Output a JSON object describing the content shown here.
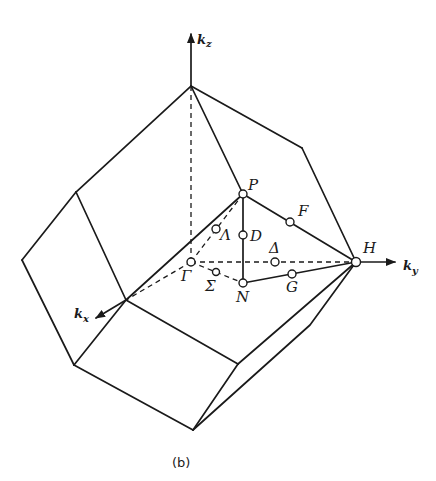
{
  "figure": {
    "caption": "(b)",
    "axes": {
      "kz": {
        "k": "k",
        "sub": "z"
      },
      "ky": {
        "k": "k",
        "sub": "y"
      },
      "kx": {
        "k": "k",
        "sub": "x"
      }
    },
    "points": {
      "P": "P",
      "F": "F",
      "H": "H",
      "D": "D",
      "Lambda": "Λ",
      "Delta": "Δ",
      "Gamma": "Γ",
      "Sigma": "Σ",
      "N": "N",
      "G": "G"
    }
  }
}
